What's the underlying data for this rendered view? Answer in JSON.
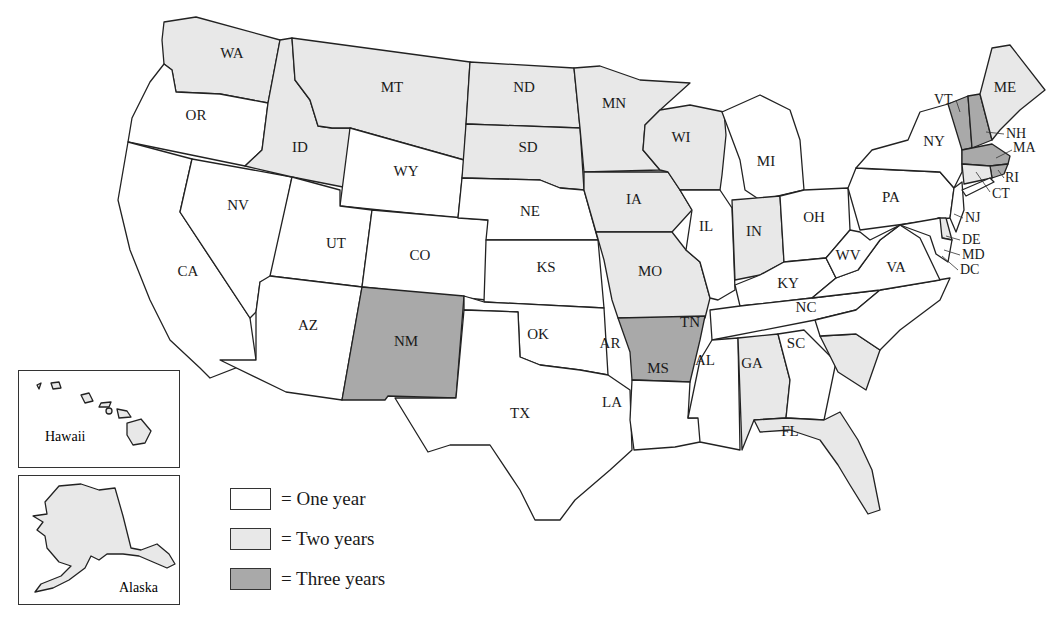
{
  "map": {
    "type": "choropleth",
    "region": "United States",
    "colors": {
      "one_year": "#ffffff",
      "two_years": "#e8e8e8",
      "three_years": "#a9a9a9"
    },
    "states": {
      "WA": 2,
      "OR": 1,
      "CA": 1,
      "NV": 1,
      "ID": 2,
      "MT": 2,
      "WY": 1,
      "UT": 1,
      "CO": 1,
      "AZ": 1,
      "NM": 3,
      "ND": 2,
      "SD": 2,
      "NE": 1,
      "KS": 1,
      "OK": 1,
      "TX": 1,
      "MN": 2,
      "IA": 2,
      "MO": 2,
      "AR": 3,
      "LA": 1,
      "WI": 2,
      "IL": 1,
      "MI": 1,
      "IN": 2,
      "OH": 1,
      "KY": 1,
      "TN": 1,
      "MS": 1,
      "AL": 2,
      "GA": 1,
      "FL": 2,
      "SC": 2,
      "NC": 1,
      "VA": 1,
      "WV": 1,
      "PA": 1,
      "NY": 1,
      "NJ": 1,
      "DE": 2,
      "MD": 1,
      "DC": 1,
      "VT": 3,
      "NH": 3,
      "MA": 3,
      "RI": 3,
      "CT": 2,
      "ME": 2,
      "HI": 2,
      "AK": 2
    }
  },
  "labels": {
    "WA": "WA",
    "OR": "OR",
    "CA": "CA",
    "NV": "NV",
    "ID": "ID",
    "MT": "MT",
    "WY": "WY",
    "UT": "UT",
    "CO": "CO",
    "AZ": "AZ",
    "NM": "NM",
    "ND": "ND",
    "SD": "SD",
    "NE": "NE",
    "KS": "KS",
    "OK": "OK",
    "TX": "TX",
    "MN": "MN",
    "IA": "IA",
    "MO": "MO",
    "AR": "AR",
    "LA": "LA",
    "WI": "WI",
    "IL": "IL",
    "MI": "MI",
    "IN": "IN",
    "OH": "OH",
    "KY": "KY",
    "TN": "TN",
    "MS": "MS",
    "AL": "AL",
    "GA": "GA",
    "FL": "FL",
    "SC": "SC",
    "NC": "NC",
    "VA": "VA",
    "WV": "WV",
    "PA": "PA",
    "NY": "NY",
    "NJ": "NJ",
    "DE": "DE",
    "MD": "MD",
    "DC": "DC",
    "VT": "VT",
    "NH": "NH",
    "MA": "MA",
    "RI": "RI",
    "CT": "CT",
    "ME": "ME"
  },
  "insets": {
    "hawaii": "Hawaii",
    "alaska": "Alaska"
  },
  "legend": [
    {
      "label": "= One year",
      "color": "#ffffff"
    },
    {
      "label": "= Two years",
      "color": "#e8e8e8"
    },
    {
      "label": "= Three years",
      "color": "#a9a9a9"
    }
  ]
}
